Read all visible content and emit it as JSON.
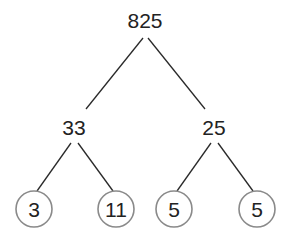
{
  "diagram": {
    "type": "factor-tree",
    "root": {
      "label": "825"
    },
    "level1": [
      {
        "label": "33"
      },
      {
        "label": "25"
      }
    ],
    "leaves": [
      {
        "label": "3",
        "circled": true
      },
      {
        "label": "11",
        "circled": true
      },
      {
        "label": "5",
        "circled": true
      },
      {
        "label": "5",
        "circled": true
      }
    ]
  }
}
